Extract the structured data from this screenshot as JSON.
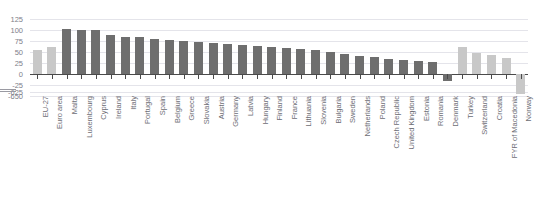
{
  "chart_data": {
    "type": "bar",
    "title": "",
    "xlabel": "",
    "ylabel": "",
    "ylim": [
      -650,
      125
    ],
    "grid": true,
    "legend": "none",
    "axis_break": {
      "from": -25,
      "to": -625
    },
    "ytick_labels": [
      "125",
      "100",
      "75",
      "50",
      "25",
      "0",
      "-25",
      "-625",
      "-650"
    ],
    "ytick_values": [
      125,
      100,
      75,
      50,
      25,
      0,
      -25,
      -625,
      -650
    ],
    "categories": [
      "EU-27",
      "Euro area",
      "Malta",
      "Luxembourg",
      "Cyprus",
      "Ireland",
      "Italy",
      "Portugal",
      "Spain",
      "Belgium",
      "Greece",
      "Slovakia",
      "Austria",
      "Germany",
      "Latvia",
      "Hungary",
      "Finland",
      "France",
      "Lithuania",
      "Slovenia",
      "Bulgaria",
      "Sweden",
      "Netherlands",
      "Poland",
      "Czech Republic",
      "United Kingdom",
      "Estonia",
      "Romania",
      "Denmark",
      "Turkey",
      "Switzerland",
      "Croatia",
      "FYR of Macedonia",
      "Norway"
    ],
    "values": [
      55,
      62,
      102,
      99,
      99,
      88,
      85,
      83,
      80,
      77,
      74,
      72,
      70,
      68,
      65,
      63,
      61,
      59,
      57,
      54,
      50,
      46,
      42,
      38,
      34,
      32,
      30,
      28,
      -15,
      62,
      47,
      43,
      36,
      -640
    ],
    "series_colors": {
      "aggregate": "#c8c8c8",
      "member-state": "#6e6e6e",
      "non-member": "#c8c8c8"
    },
    "point_groups": [
      "aggregate",
      "aggregate",
      "member-state",
      "member-state",
      "member-state",
      "member-state",
      "member-state",
      "member-state",
      "member-state",
      "member-state",
      "member-state",
      "member-state",
      "member-state",
      "member-state",
      "member-state",
      "member-state",
      "member-state",
      "member-state",
      "member-state",
      "member-state",
      "member-state",
      "member-state",
      "member-state",
      "member-state",
      "member-state",
      "member-state",
      "member-state",
      "member-state",
      "member-state",
      "non-member",
      "non-member",
      "non-member",
      "non-member",
      "non-member"
    ]
  },
  "figure": {
    "clipped_title": ""
  }
}
